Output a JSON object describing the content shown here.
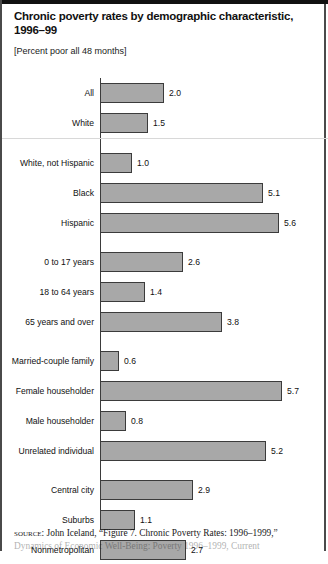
{
  "figure": {
    "title": "Chronic poverty rates by demographic characteristic, 1996–99",
    "subtitle": "[Percent poor all 48 months]"
  },
  "source": {
    "kicker": "source:",
    "line1": "John Iceland, “Figure 7. Chronic Poverty Rates: 1996–1999,”",
    "line2": "Dynamics of Economic Well-Being: Poverty 1996–1999, Current"
  },
  "chart_data": {
    "type": "bar",
    "orientation": "horizontal",
    "title": "Chronic poverty rates by demographic characteristic, 1996–99",
    "subtitle": "[Percent poor all 48 months]",
    "xlabel": "",
    "ylabel": "",
    "xlim": [
      0,
      6
    ],
    "grid": false,
    "legend": false,
    "units": "percent",
    "bar_color": "#a8a8a8",
    "bar_border_color": "#3b3b3b",
    "categories": [
      "All",
      "White",
      "White, not Hispanic",
      "Black",
      "Hispanic",
      "0 to 17 years",
      "18 to 64 years",
      "65 years and over",
      "Married-couple family",
      "Female householder",
      "Male householder",
      "Unrelated individual",
      "Central city",
      "Suburbs",
      "Nonmetropolitan"
    ],
    "values": [
      2.0,
      1.5,
      1.0,
      5.1,
      5.6,
      2.6,
      1.4,
      3.8,
      0.6,
      5.7,
      0.8,
      5.2,
      2.9,
      1.1,
      2.7
    ],
    "groups": [
      {
        "ruled": true,
        "rows": [
          {
            "label": "All",
            "value": 2.0,
            "value_text": "2.0"
          },
          {
            "label": "White",
            "value": 1.5,
            "value_text": "1.5"
          }
        ]
      },
      {
        "ruled": false,
        "rows": [
          {
            "label": "White, not Hispanic",
            "value": 1.0,
            "value_text": "1.0"
          },
          {
            "label": "Black",
            "value": 5.1,
            "value_text": "5.1"
          },
          {
            "label": "Hispanic",
            "value": 5.6,
            "value_text": "5.6"
          }
        ]
      },
      {
        "ruled": false,
        "rows": [
          {
            "label": "0 to 17 years",
            "value": 2.6,
            "value_text": "2.6"
          },
          {
            "label": "18 to 64 years",
            "value": 1.4,
            "value_text": "1.4"
          },
          {
            "label": "65 years and over",
            "value": 3.8,
            "value_text": "3.8"
          }
        ]
      },
      {
        "ruled": false,
        "rows": [
          {
            "label": "Married-couple family",
            "value": 0.6,
            "value_text": "0.6"
          },
          {
            "label": "Female householder",
            "value": 5.7,
            "value_text": "5.7"
          },
          {
            "label": "Male householder",
            "value": 0.8,
            "value_text": "0.8"
          },
          {
            "label": "Unrelated individual",
            "value": 5.2,
            "value_text": "5.2"
          }
        ]
      },
      {
        "ruled": false,
        "rows": [
          {
            "label": "Central city",
            "value": 2.9,
            "value_text": "2.9"
          },
          {
            "label": "Suburbs",
            "value": 1.1,
            "value_text": "1.1"
          },
          {
            "label": "Nonmetropolitan",
            "value": 2.7,
            "value_text": "2.7"
          }
        ]
      }
    ]
  }
}
